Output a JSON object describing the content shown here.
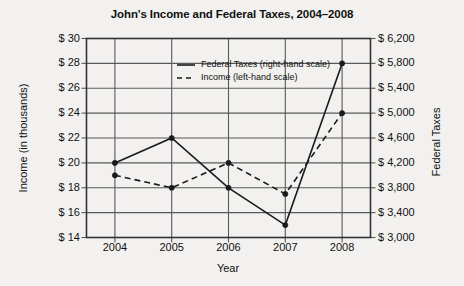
{
  "chart_data": {
    "type": "line",
    "title": "John's Income and Federal Taxes, 2004–2008",
    "xlabel": "Year",
    "ylabel": "Income (in thousands)",
    "y2label": "Federal Taxes",
    "grid": true,
    "legend_position": "inside-top-center",
    "categories": [
      "2004",
      "2005",
      "2006",
      "2007",
      "2008"
    ],
    "x": [
      2004,
      2005,
      2006,
      2007,
      2008
    ],
    "ylim": [
      14,
      30
    ],
    "yticks": [
      14,
      16,
      18,
      20,
      22,
      24,
      26,
      28,
      30
    ],
    "ytick_labels": [
      "$ 14",
      "$ 16",
      "$ 18",
      "$ 20",
      "$ 22",
      "$ 24",
      "$ 26",
      "$ 28",
      "$ 30"
    ],
    "y2lim": [
      3000,
      6200
    ],
    "y2ticks": [
      3000,
      3400,
      3800,
      4200,
      4600,
      5000,
      5400,
      5800,
      6200
    ],
    "y2tick_labels": [
      "$ 3,000",
      "$ 3,400",
      "$ 3,800",
      "$ 4,200",
      "$ 4,600",
      "$ 5,000",
      "$ 5,400",
      "$ 5,800",
      "$ 6,200"
    ],
    "series": [
      {
        "name": "Federal Taxes (right-hand scale)",
        "axis": "right",
        "style": "solid",
        "marker": "filled-circle",
        "values": [
          4200,
          4600,
          3800,
          3200,
          5800
        ]
      },
      {
        "name": "Income (left-hand scale)",
        "axis": "left",
        "style": "dashed",
        "marker": "filled-circle",
        "values": [
          19,
          18,
          20,
          17.5,
          24
        ]
      }
    ],
    "colors": {
      "line": "#1a1a1a",
      "grid": "#595959",
      "frame": "#333333",
      "background": "#f2f1ef"
    }
  },
  "legend": {
    "items": [
      {
        "label": "Federal Taxes (right-hand scale)",
        "style": "solid"
      },
      {
        "label": "Income (left-hand scale)",
        "style": "dashed"
      }
    ]
  }
}
